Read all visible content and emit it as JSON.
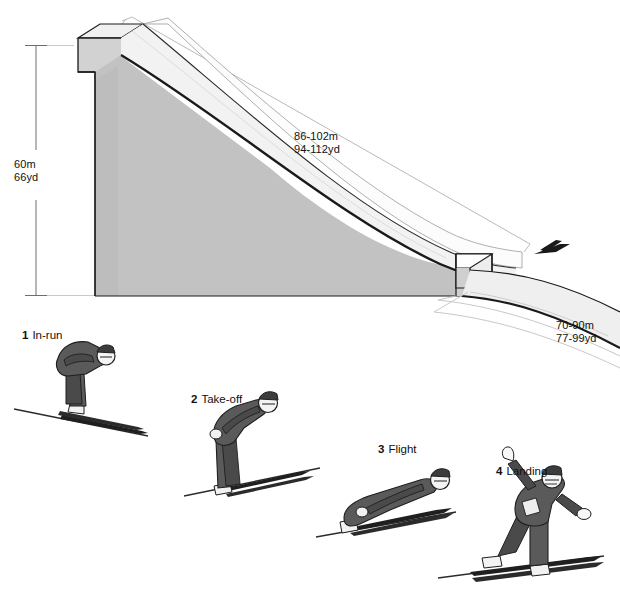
{
  "diagram": {
    "dimensions": {
      "hill_height": "60m\n66yd",
      "hill_height_metric": "60m",
      "hill_height_imperial": "66yd",
      "inrun_length": "86-102m\n94-112yd",
      "inrun_length_metric": "86-102m",
      "inrun_length_imperial": "94-112yd",
      "landing_distance": "70-90m\n77-99yd",
      "landing_distance_metric": "70-90m",
      "landing_distance_imperial": "77-99yd"
    },
    "stages": [
      {
        "number": "1",
        "label": "In-run"
      },
      {
        "number": "2",
        "label": "Take-off"
      },
      {
        "number": "3",
        "label": "Flight"
      },
      {
        "number": "4",
        "label": "Landing"
      }
    ],
    "colors": {
      "hill_face": "#c2c2c2",
      "hill_face_dark": "#b4b4b4",
      "ramp_surface": "#f7f7f7",
      "ramp_side": "#e2e2e2",
      "landing_slope": "#efefef",
      "outline": "#1a1a1a",
      "thin_line": "#8d8d8d",
      "suit": "#5a5a5a",
      "suit_dark": "#3c3c3c",
      "skin": "#ffffff",
      "background": "#ffffff"
    },
    "icons": {
      "airborne_jumper": "airborne-jumper-silhouette",
      "dimension_line_vertical": "vertical-dimension-line",
      "dimension_line_inrun": "inrun-dimension-line",
      "dimension_line_landing": "landing-dimension-line"
    }
  }
}
